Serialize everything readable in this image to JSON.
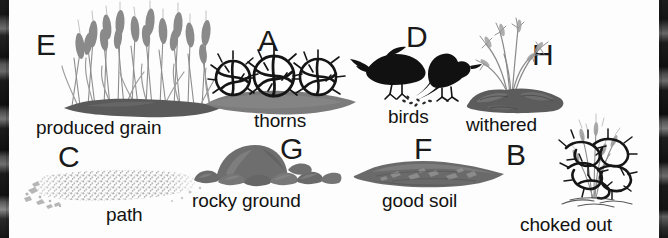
{
  "figure": {
    "background_color": "#ffffff",
    "edge_color": "#1a1a1a",
    "text_color": "#121212",
    "soil_dark": "#5e5e5e",
    "soil_mid": "#7a7a7a",
    "path_gray": "#b9b9b9",
    "rock_gray": "#6f6f6f",
    "bird_black": "#111111",
    "thorn_black": "#141414",
    "grain_gray": "#8e8e8e"
  },
  "items": [
    {
      "id": "produced-grain",
      "marker": "E",
      "label": "produced grain",
      "icon": "wheat-stalks-icon",
      "row": 1,
      "column": 1
    },
    {
      "id": "thorns",
      "marker": "A",
      "label": "thorns",
      "icon": "thorn-bushes-icon",
      "row": 1,
      "column": 2
    },
    {
      "id": "birds",
      "marker": "D",
      "label": "birds",
      "icon": "two-crows-icon",
      "row": 1,
      "column": 3
    },
    {
      "id": "withered",
      "marker": "H",
      "label": "withered",
      "icon": "withered-plant-icon",
      "row": 1,
      "column": 4
    },
    {
      "id": "path",
      "marker": "C",
      "label": "path",
      "icon": "gravel-path-icon",
      "row": 2,
      "column": 1
    },
    {
      "id": "rocky-ground",
      "marker": "G",
      "label": "rocky ground",
      "icon": "rocks-icon",
      "row": 2,
      "column": 2
    },
    {
      "id": "good-soil",
      "marker": "F",
      "label": "good soil",
      "icon": "soil-mound-icon",
      "row": 2,
      "column": 3
    },
    {
      "id": "choked-out",
      "marker": "B",
      "label": "choked out",
      "icon": "choked-plant-icon",
      "row": 2,
      "column": 4
    }
  ]
}
